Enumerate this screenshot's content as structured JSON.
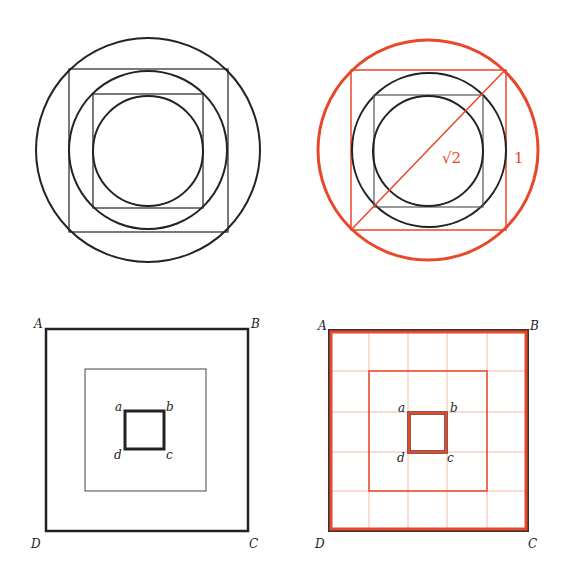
{
  "colors": {
    "ink": "#222222",
    "accent": "#e8472a",
    "grid": "#f0a898"
  },
  "figures": {
    "top_left": {
      "description": "Nested circles and squares"
    },
    "top_right": {
      "description": "Nested circles and squares with red outer circle, red square and diagonal",
      "labels": {
        "diagonal": "√2",
        "side": "1"
      }
    },
    "bottom_left": {
      "description": "Three concentric squares",
      "outer_labels": {
        "A": "A",
        "B": "B",
        "C": "C",
        "D": "D"
      },
      "inner_labels": {
        "a": "a",
        "b": "b",
        "c": "c",
        "d": "d"
      }
    },
    "bottom_right": {
      "description": "Three concentric squares on a 5x5 grid",
      "grid_divisions": 5,
      "outer_labels": {
        "A": "A",
        "B": "B",
        "C": "C",
        "D": "D"
      },
      "inner_labels": {
        "a": "a",
        "b": "b",
        "c": "c",
        "d": "d"
      }
    }
  }
}
